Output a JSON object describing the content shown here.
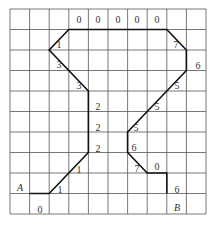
{
  "grid": {
    "origin_x": 10,
    "origin_y": 9,
    "cols": 10,
    "rows": 10,
    "col_width": 19.6,
    "row_height": 20.5,
    "line_color": "#555555"
  },
  "path": {
    "color": "#111111",
    "vertices": [
      [
        1,
        9
      ],
      [
        2,
        9
      ],
      [
        4,
        7
      ],
      [
        4,
        4
      ],
      [
        2,
        2
      ],
      [
        3,
        1
      ],
      [
        8,
        1
      ],
      [
        9,
        2
      ],
      [
        9,
        3
      ],
      [
        6,
        6
      ],
      [
        6,
        7
      ],
      [
        7,
        8
      ],
      [
        8,
        8
      ],
      [
        8,
        9
      ]
    ]
  },
  "labels": [
    {
      "text": "A",
      "x": 20,
      "y": 191,
      "italic": true
    },
    {
      "text": "B",
      "x": 177,
      "y": 211,
      "italic": true
    },
    {
      "text": "0",
      "x": 40,
      "y": 213
    },
    {
      "text": "1",
      "x": 60,
      "y": 193
    },
    {
      "text": "1",
      "x": 79,
      "y": 173
    },
    {
      "text": "2",
      "x": 98,
      "y": 152
    },
    {
      "text": "2",
      "x": 98,
      "y": 131
    },
    {
      "text": "2",
      "x": 98,
      "y": 110
    },
    {
      "text": "3",
      "x": 79,
      "y": 89
    },
    {
      "text": "3",
      "x": 59,
      "y": 68
    },
    {
      "text": "1",
      "x": 59,
      "y": 48
    },
    {
      "text": "0",
      "x": 79,
      "y": 23
    },
    {
      "text": "0",
      "x": 98,
      "y": 23
    },
    {
      "text": "0",
      "x": 118,
      "y": 23
    },
    {
      "text": "0",
      "x": 137,
      "y": 23
    },
    {
      "text": "0",
      "x": 157,
      "y": 23
    },
    {
      "text": "7",
      "x": 176,
      "y": 48
    },
    {
      "text": "6",
      "x": 198,
      "y": 69
    },
    {
      "text": "5",
      "x": 177,
      "y": 89
    },
    {
      "text": "5",
      "x": 157,
      "y": 110
    },
    {
      "text": "5",
      "x": 136,
      "y": 131
    },
    {
      "text": "6",
      "x": 134,
      "y": 151
    },
    {
      "text": "7",
      "x": 137,
      "y": 172
    },
    {
      "text": "0",
      "x": 157,
      "y": 170
    },
    {
      "text": "6",
      "x": 177,
      "y": 193
    }
  ]
}
